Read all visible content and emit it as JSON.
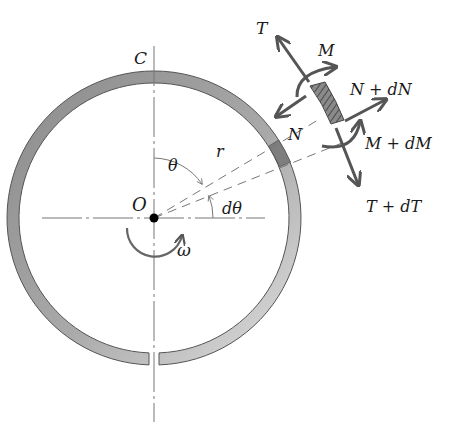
{
  "figure": {
    "labels": {
      "C": "C",
      "O": "O",
      "theta": "θ",
      "r": "r",
      "dtheta": "dθ",
      "omega": "ω",
      "T": "T",
      "M": "M",
      "N": "N",
      "N_dN": "N + dN",
      "M_dM": "M + dM",
      "T_dT": "T + dT"
    },
    "colors": {
      "ring_fill_dark": "#8f8f8f",
      "ring_fill_light": "#d8d8d8",
      "element_fill": "#7a7a7a",
      "arrow": "#555555",
      "line": "#777777",
      "text": "#1a1a1a"
    }
  }
}
